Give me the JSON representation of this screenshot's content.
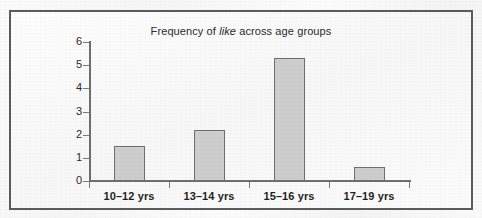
{
  "figure": {
    "frame_color": "#5b5b5b",
    "background_color": "#fafafa"
  },
  "chart_data": {
    "type": "bar",
    "title": "Frequency of like across age groups",
    "title_parts": {
      "before": "Frequency of ",
      "emphasis": "like",
      "after": " across age groups"
    },
    "categories": [
      "10–12 yrs",
      "13–14 yrs",
      "15–16 yrs",
      "17–19 yrs"
    ],
    "values": [
      1.5,
      2.2,
      5.3,
      0.6
    ],
    "xlabel": "",
    "ylabel": "",
    "ylim": [
      0,
      6
    ],
    "yticks": [
      "0",
      "1",
      "2",
      "3",
      "4",
      "5",
      "6"
    ],
    "grid": false,
    "legend": false,
    "bar_fill_color": "#cdcdcd",
    "bar_edge_color": "#6f6f6f",
    "axis_color": "#6e6e6e"
  }
}
